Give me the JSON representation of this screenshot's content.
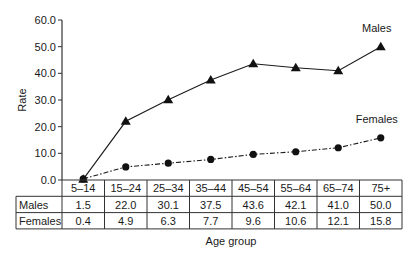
{
  "chart_data": {
    "type": "line",
    "title": "",
    "xlabel": "Age group",
    "ylabel": "Rate",
    "ylim": [
      0,
      60
    ],
    "yticks": [
      "0.0",
      "10.0",
      "20.0",
      "30.0",
      "40.0",
      "50.0",
      "60.0"
    ],
    "grid": false,
    "legend": "inline labels at line ends",
    "categories": [
      "5–14",
      "15–24",
      "25–34",
      "35–44",
      "45–54",
      "55–64",
      "65–74",
      "75+"
    ],
    "series": [
      {
        "name": "Males",
        "marker": "triangle",
        "line_style": "solid",
        "values": [
          1.5,
          22.0,
          30.1,
          37.5,
          43.6,
          42.1,
          41.0,
          50.0
        ],
        "display": [
          "1.5",
          "22.0",
          "30.1",
          "37.5",
          "43.6",
          "42.1",
          "41.0",
          "50.0"
        ]
      },
      {
        "name": "Females",
        "marker": "circle",
        "line_style": "dash-dot",
        "values": [
          0.4,
          4.9,
          6.3,
          7.7,
          9.6,
          10.6,
          12.1,
          15.8
        ],
        "display": [
          "0.4",
          "4.9",
          "6.3",
          "7.7",
          "9.6",
          "10.6",
          "12.1",
          "15.8"
        ]
      }
    ],
    "data_table": {
      "row_labels": [
        "Males",
        "Females"
      ],
      "position": "below x-axis"
    }
  },
  "colors": {
    "line": "#1a1a1a",
    "marker": "#111111",
    "grid_border": "#333333"
  }
}
